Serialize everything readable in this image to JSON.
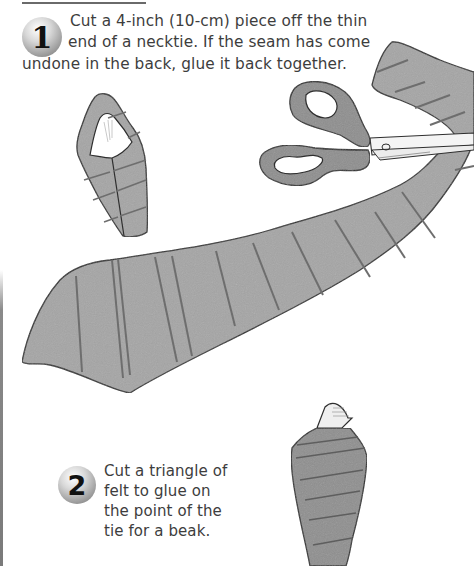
{
  "steps": [
    {
      "number": "1",
      "text_lines": [
        "Cut a 4-inch (10-cm) piece off the thin",
        "end of a necktie. If the seam has come",
        "undone in the back, glue it back together."
      ]
    },
    {
      "number": "2",
      "text": "Cut a triangle of felt to glue on the point of the tie for a beak."
    }
  ],
  "illustrations": {
    "folded_tie_piece": "folded-tie-piece-illustration",
    "scissors": "scissors-illustration",
    "necktie": "necktie-illustration",
    "tie_with_beak": "tie-with-beak-illustration"
  },
  "colors": {
    "tie_fill": "#a3a3a3",
    "tie_stroke": "#333333",
    "stripe": "#6e6e6e",
    "scissors_handle": "#8e8e8e",
    "blade": "#f4f4f4",
    "text": "#3d3d3d"
  }
}
